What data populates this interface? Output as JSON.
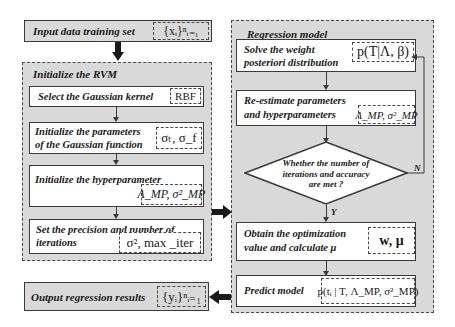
{
  "input": {
    "label": "Input data training set",
    "math": "{xᵢ}ⁿᵢ₌₁"
  },
  "init_rvm": {
    "title": "Initialize the RVM",
    "steps": [
      {
        "label": "Select the Gaussian kernel",
        "math": "RBF"
      },
      {
        "label_line1": "Initialize the parameters",
        "label_line2": "of the Gaussian function",
        "math": "σₜ, σ_f"
      },
      {
        "label": "Initialize the hyperparameter",
        "math": "Λ_MP, σ²_MP"
      },
      {
        "label_line1": "Set the precision and number of",
        "label_line2": "iterations",
        "math": "σ², max _iter"
      }
    ]
  },
  "output": {
    "label": "Output regression results",
    "math": "{yᵢ}ⁿᵢ₌₁"
  },
  "regression": {
    "title": "Regression model",
    "steps": [
      {
        "label_line1": "Solve the weight",
        "label_line2": "posteriori distribution",
        "math": "p(T|Λ, β)"
      },
      {
        "label_line1": "Re-estimate parameters",
        "label_line2": "and hyperparameters",
        "math": "Λ_MP, σ²_MP"
      },
      {
        "label_line1": "Obtain the optimization",
        "label_line2": "value and calculate μ",
        "math": "w, μ"
      },
      {
        "label": "Predict model",
        "math": "p(tᵢ | T, Λ_MP, σ²_MP)"
      }
    ],
    "decision": {
      "line1": "Whether the number of",
      "line2": "iterations and accuracy",
      "line3": "are met ?",
      "yes": "Y",
      "no": "N"
    }
  },
  "colors": {
    "group_fill": "#d9d9d9",
    "box_fill": "#ffffff",
    "stroke": "#3a3a3a"
  }
}
